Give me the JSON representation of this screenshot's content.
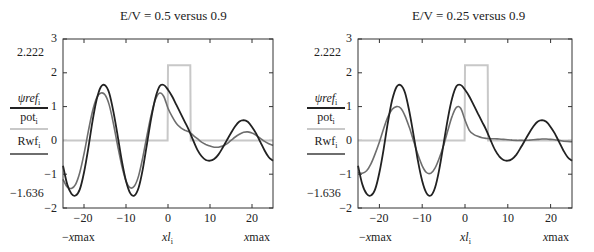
{
  "chart_data": [
    {
      "type": "line",
      "title": "E/V = 0.5 versus 0.9",
      "xlabel_left": "−xmax",
      "xlabel_center": "xl",
      "xlabel_center_sub": "i",
      "xlabel_right": "xmax",
      "xlim": [
        -25,
        25
      ],
      "ylim": [
        -2,
        3
      ],
      "x_ticks": [
        -20,
        -10,
        0,
        10,
        20
      ],
      "y_ticks": [
        -2,
        -1,
        0,
        1,
        2,
        3
      ],
      "y_markers": [
        2.222,
        -1.636
      ],
      "legend": [
        {
          "name": "ψref",
          "sub": "i",
          "color": "#222222"
        },
        {
          "name": "pot",
          "sub": "i",
          "color": "#c8c8c8"
        },
        {
          "name": "Rwf",
          "sub": "i",
          "color": "#6e6e6e"
        }
      ],
      "series": [
        {
          "name": "ψref_i",
          "color": "#222222",
          "x": [
            -25,
            -24,
            -23,
            -22,
            -21,
            -20,
            -19,
            -18,
            -17,
            -16,
            -15,
            -14,
            -13,
            -12,
            -11,
            -10,
            -9,
            -8,
            -7,
            -6,
            -5,
            -4,
            -3,
            -2,
            -1,
            0,
            1,
            2,
            3,
            4,
            5,
            6,
            7,
            8,
            9,
            10,
            11,
            12,
            13,
            14,
            15,
            16,
            17,
            18,
            19,
            20,
            21,
            22,
            23,
            24,
            25
          ],
          "y": [
            -0.75,
            -1.3,
            -1.58,
            -1.63,
            -1.45,
            -0.95,
            -0.25,
            0.55,
            1.2,
            1.58,
            1.63,
            1.4,
            0.85,
            0.15,
            -0.6,
            -1.2,
            -1.56,
            -1.63,
            -1.4,
            -0.85,
            -0.1,
            0.65,
            1.25,
            1.6,
            1.64,
            1.5,
            1.3,
            1.05,
            0.8,
            0.55,
            0.3,
            0.0,
            -0.28,
            -0.47,
            -0.58,
            -0.6,
            -0.55,
            -0.42,
            -0.22,
            0.0,
            0.22,
            0.42,
            0.56,
            0.6,
            0.55,
            0.4,
            0.2,
            -0.05,
            -0.3,
            -0.5,
            -0.6
          ]
        },
        {
          "name": "pot_i",
          "color": "#c8c8c8",
          "x": [
            -25,
            -0.1,
            0,
            5.3,
            5.4,
            25
          ],
          "y": [
            0,
            0,
            2.222,
            2.222,
            0,
            0
          ]
        },
        {
          "name": "Rwf_i (E/V=0.5)",
          "color": "#6e6e6e",
          "x": [
            -25,
            -24,
            -23,
            -22,
            -21,
            -20,
            -19,
            -18,
            -17,
            -16,
            -15,
            -14,
            -13,
            -12,
            -11,
            -10,
            -9,
            -8,
            -7,
            -6,
            -5,
            -4,
            -3,
            -2,
            -1,
            0,
            1,
            2,
            3,
            4,
            5,
            6,
            7,
            8,
            9,
            10,
            11,
            12,
            13,
            14,
            15,
            16,
            17,
            18,
            19,
            20,
            21,
            22,
            23,
            24,
            25
          ],
          "y": [
            -1.15,
            -1.38,
            -1.42,
            -1.3,
            -0.95,
            -0.4,
            0.25,
            0.85,
            1.25,
            1.4,
            1.35,
            1.05,
            0.5,
            -0.15,
            -0.75,
            -1.2,
            -1.4,
            -1.35,
            -1.05,
            -0.5,
            0.15,
            0.75,
            1.2,
            1.4,
            1.3,
            0.95,
            0.7,
            0.5,
            0.38,
            0.3,
            0.25,
            0.15,
            0.05,
            -0.05,
            -0.12,
            -0.17,
            -0.2,
            -0.2,
            -0.17,
            -0.1,
            0.0,
            0.1,
            0.18,
            0.24,
            0.25,
            0.22,
            0.15,
            0.06,
            -0.03,
            -0.1,
            -0.15
          ]
        }
      ]
    },
    {
      "type": "line",
      "title": "E/V = 0.25 versus 0.9",
      "xlabel_left": "−xmax",
      "xlabel_center": "xl",
      "xlabel_center_sub": "i",
      "xlabel_right": "xmax",
      "xlim": [
        -25,
        25
      ],
      "ylim": [
        -2,
        3
      ],
      "x_ticks": [
        -20,
        -10,
        0,
        10,
        20
      ],
      "y_ticks": [
        -2,
        -1,
        0,
        1,
        2,
        3
      ],
      "y_markers": [
        2.222,
        -1.636
      ],
      "legend": [
        {
          "name": "ψref",
          "sub": "i",
          "color": "#222222"
        },
        {
          "name": "pot",
          "sub": "i",
          "color": "#c8c8c8"
        },
        {
          "name": "Rwf",
          "sub": "i",
          "color": "#6e6e6e"
        }
      ],
      "series": [
        {
          "name": "ψref_i",
          "color": "#222222",
          "x": [
            -25,
            -24,
            -23,
            -22,
            -21,
            -20,
            -19,
            -18,
            -17,
            -16,
            -15,
            -14,
            -13,
            -12,
            -11,
            -10,
            -9,
            -8,
            -7,
            -6,
            -5,
            -4,
            -3,
            -2,
            -1,
            0,
            1,
            2,
            3,
            4,
            5,
            6,
            7,
            8,
            9,
            10,
            11,
            12,
            13,
            14,
            15,
            16,
            17,
            18,
            19,
            20,
            21,
            22,
            23,
            24,
            25
          ],
          "y": [
            -0.75,
            -1.3,
            -1.58,
            -1.63,
            -1.45,
            -0.95,
            -0.25,
            0.55,
            1.2,
            1.58,
            1.63,
            1.4,
            0.85,
            0.15,
            -0.6,
            -1.2,
            -1.56,
            -1.63,
            -1.4,
            -0.85,
            -0.1,
            0.65,
            1.25,
            1.6,
            1.64,
            1.5,
            1.3,
            1.05,
            0.8,
            0.55,
            0.3,
            0.0,
            -0.28,
            -0.47,
            -0.58,
            -0.6,
            -0.55,
            -0.42,
            -0.22,
            0.0,
            0.22,
            0.42,
            0.56,
            0.6,
            0.55,
            0.4,
            0.2,
            -0.05,
            -0.3,
            -0.5,
            -0.6
          ]
        },
        {
          "name": "pot_i",
          "color": "#c8c8c8",
          "x": [
            -25,
            -0.1,
            0,
            5.3,
            5.4,
            25
          ],
          "y": [
            0,
            0,
            2.222,
            2.222,
            0,
            0
          ]
        },
        {
          "name": "Rwf_i (E/V=0.25)",
          "color": "#6e6e6e",
          "x": [
            -25,
            -24,
            -23,
            -22,
            -21,
            -20,
            -19,
            -18,
            -17,
            -16,
            -15,
            -14,
            -13,
            -12,
            -11,
            -10,
            -9,
            -8,
            -7,
            -6,
            -5,
            -4,
            -3,
            -2,
            -1,
            0,
            1,
            2,
            3,
            4,
            5,
            6,
            7,
            8,
            9,
            10,
            11,
            12,
            13,
            14,
            15,
            16,
            17,
            18,
            19,
            20,
            21,
            22,
            23,
            24,
            25
          ],
          "y": [
            -0.95,
            -0.97,
            -0.9,
            -0.7,
            -0.4,
            -0.05,
            0.35,
            0.7,
            0.92,
            1.0,
            0.95,
            0.72,
            0.38,
            -0.02,
            -0.42,
            -0.75,
            -0.95,
            -0.97,
            -0.82,
            -0.52,
            -0.15,
            0.3,
            0.72,
            0.98,
            0.95,
            0.6,
            0.3,
            0.18,
            0.12,
            0.08,
            0.06,
            0.05,
            0.05,
            0.04,
            0.03,
            0.02,
            0.01,
            0.0,
            0.0,
            0.0,
            0.01,
            0.02,
            0.03,
            0.04,
            0.04,
            0.03,
            0.02,
            0.0,
            -0.02,
            -0.03,
            -0.04
          ]
        }
      ]
    }
  ],
  "panels": [
    {
      "title": "E/V = 0.5 versus 0.9",
      "marker_top": "2.222",
      "marker_bottom": "−1.636",
      "yticks": [
        "3",
        "2",
        "1",
        "0",
        "−1",
        "−2"
      ],
      "xticks": [
        "−20",
        "−10",
        "0",
        "10",
        "20"
      ],
      "xlab_left": "−",
      "xlab_left_it": "x",
      "xlab_left_rest": "max",
      "xlab_center": "xl",
      "xlab_center_sub": "i",
      "xlab_right_it": "x",
      "xlab_right_rest": "max",
      "legend": [
        {
          "name": "ψref",
          "sub": "i"
        },
        {
          "name": "pot",
          "sub": "i"
        },
        {
          "name": "Rwf",
          "sub": "i"
        }
      ]
    },
    {
      "title": "E/V = 0.25 versus 0.9",
      "marker_top": "2.222",
      "marker_bottom": "−1.636",
      "yticks": [
        "3",
        "2",
        "1",
        "0",
        "−1",
        "−2"
      ],
      "xticks": [
        "−20",
        "−10",
        "0",
        "10",
        "20"
      ],
      "xlab_left": "−",
      "xlab_left_it": "x",
      "xlab_left_rest": "max",
      "xlab_center": "xl",
      "xlab_center_sub": "i",
      "xlab_right_it": "x",
      "xlab_right_rest": "max",
      "legend": [
        {
          "name": "ψref",
          "sub": "i"
        },
        {
          "name": "pot",
          "sub": "i"
        },
        {
          "name": "Rwf",
          "sub": "i"
        }
      ]
    }
  ]
}
